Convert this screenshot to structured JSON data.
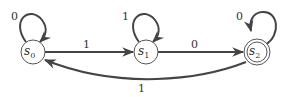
{
  "diagram": {
    "type": "finite-state-machine",
    "states": [
      {
        "id": "s0",
        "name": "s",
        "sub": "0",
        "accepting": false
      },
      {
        "id": "s1",
        "name": "s",
        "sub": "1",
        "accepting": false
      },
      {
        "id": "s2",
        "name": "s",
        "sub": "2",
        "accepting": true
      }
    ],
    "transitions": [
      {
        "from": "s0",
        "to": "s0",
        "label": "0"
      },
      {
        "from": "s0",
        "to": "s1",
        "label": "1"
      },
      {
        "from": "s1",
        "to": "s1",
        "label": "1"
      },
      {
        "from": "s1",
        "to": "s2",
        "label": "0"
      },
      {
        "from": "s2",
        "to": "s2",
        "label": "0"
      },
      {
        "from": "s2",
        "to": "s0",
        "label": "1"
      }
    ],
    "colors": {
      "stroke": "#444444",
      "text": "#333333"
    }
  }
}
